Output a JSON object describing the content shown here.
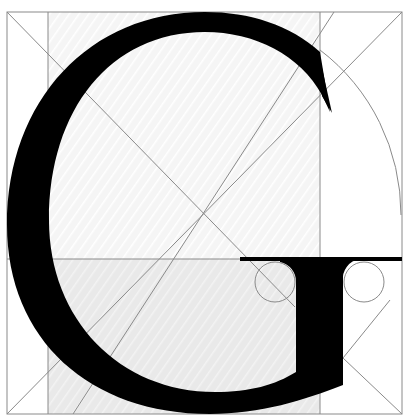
{
  "figure": {
    "letter": "G",
    "colors": {
      "background": "#ffffff",
      "glyph": "#000000",
      "guide_lines": "#8a8a8a",
      "shaded_panel": "#ececec",
      "light_panel": "#f6f6f6"
    }
  }
}
